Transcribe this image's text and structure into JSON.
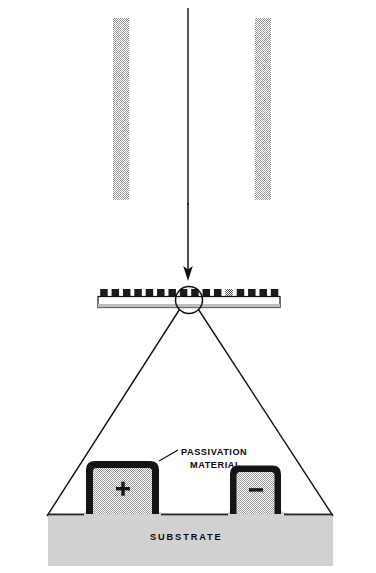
{
  "figure": {
    "type": "technical-cross-section-diagram",
    "title_visible": false,
    "background_color": "#ffffff",
    "ink_color": "#111111",
    "halftone_gray": "#8a8a8a",
    "fill_gray": "#c8c8c8",
    "substrate_gray": "#d6d6d6"
  },
  "labels": {
    "passivation_line1": "PASSIVATION",
    "passivation_line2": "MATERIAL",
    "substrate": "SUBSTRATE",
    "electrode_positive": "+",
    "electrode_negative": "–"
  },
  "top_view": {
    "name": "interdigitated-comb-electrode-pattern",
    "bounds": {
      "x": 113,
      "y": 18,
      "width": 158,
      "height": 182
    },
    "left_bus_x": 113,
    "right_bus_x": 255,
    "bus_width": 16,
    "finger_count": 13,
    "finger_height": 10,
    "finger_gap": 3.3,
    "fill": "halftone-gray",
    "center_line_x": 188
  },
  "arrow": {
    "name": "projection-arrow",
    "x": 188,
    "y_start": 200,
    "y_end": 279,
    "direction": "down"
  },
  "wafer_strip": {
    "name": "substrate-wafer-strip",
    "x": 98,
    "y": 296,
    "width": 182,
    "height": 12,
    "chip_count": 16,
    "chip_width": 7.5,
    "chip_height": 8,
    "chip_y": 289
  },
  "detail_circle": {
    "name": "magnification-callout-circle",
    "cx": 189,
    "cy": 300,
    "r": 13
  },
  "leader_lines": [
    {
      "name": "leader-line-left",
      "x1": 180,
      "y1": 310,
      "x2": 48,
      "y2": 514
    },
    {
      "name": "leader-line-right",
      "x1": 198,
      "y1": 310,
      "x2": 332,
      "y2": 514
    }
  ],
  "cross_section": {
    "name": "magnified-cross-section",
    "electrodes": [
      {
        "name": "electrode-positive",
        "symbol": "+",
        "x": 88,
        "y": 461,
        "width": 69,
        "height": 53
      },
      {
        "name": "electrode-negative",
        "symbol": "–",
        "x": 232,
        "y": 465,
        "width": 47,
        "height": 49
      }
    ],
    "substrate": {
      "x": 48,
      "y": 512,
      "width": 284,
      "height": 52
    },
    "passivation_leader": {
      "x1": 160,
      "y1": 451,
      "x2": 176,
      "y2": 462
    }
  },
  "label_positions": {
    "passivation_line1": {
      "x": 181,
      "y": 455
    },
    "passivation_line2": {
      "x": 190,
      "y": 467
    },
    "substrate": {
      "x": 150,
      "y": 540
    }
  }
}
